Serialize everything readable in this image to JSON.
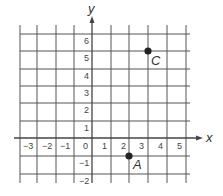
{
  "diagram": {
    "type": "coordinate-grid",
    "x_axis_label": "x",
    "y_axis_label": "y",
    "x_ticks": [
      "−3",
      "−2",
      "−1",
      "0",
      "1",
      "2",
      "3",
      "4",
      "5"
    ],
    "y_ticks": [
      "6",
      "5",
      "4",
      "3",
      "2",
      "1",
      "−1",
      "−2"
    ],
    "x_range": [
      -4,
      5
    ],
    "y_range": [
      -2,
      6
    ],
    "points": [
      {
        "name": "C",
        "x": 3,
        "y": 5
      },
      {
        "name": "A",
        "x": 2,
        "y": -1
      }
    ],
    "colors": {
      "grid": "#555555",
      "point": "#222222",
      "text": "#444444"
    }
  }
}
